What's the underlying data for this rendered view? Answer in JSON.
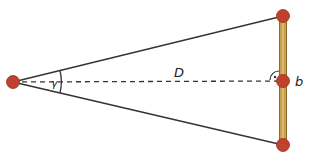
{
  "diagram": {
    "labels": {
      "angle": "γ",
      "distance": "D",
      "baseline": "b"
    },
    "colors": {
      "dot": "#c0412e",
      "dot_stroke": "#9a2f20",
      "bar": "#c9a050",
      "bar_edge": "#8a6a30",
      "line": "#333333"
    },
    "points": {
      "apex": [
        13,
        82
      ],
      "top": [
        283,
        16
      ],
      "middle": [
        283,
        81
      ],
      "bottom": [
        283,
        145
      ]
    }
  }
}
